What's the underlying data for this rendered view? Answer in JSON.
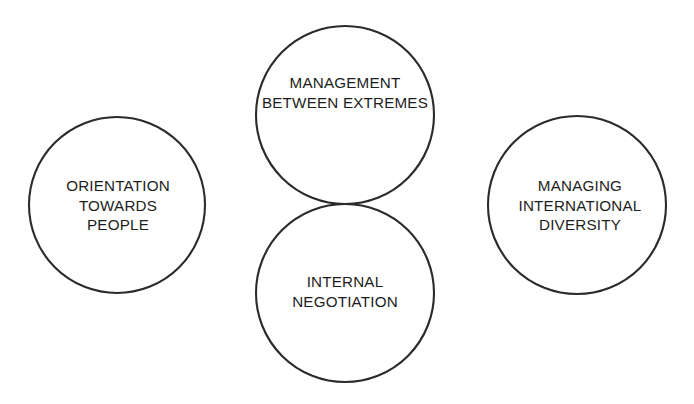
{
  "diagram": {
    "type": "four-circle-venn",
    "background_color": "#ffffff",
    "stroke_color": "#2b2b2b",
    "text_color": "#1d1d1d",
    "circles": [
      {
        "id": "management-between-extremes",
        "position": "top",
        "cx": 345,
        "cy": 115,
        "r": 89,
        "label_lines": [
          "MANAGEMENT",
          "BETWEEN EXTREMES"
        ]
      },
      {
        "id": "orientation-towards-people",
        "position": "left",
        "cx": 117,
        "cy": 205,
        "r": 88,
        "label_lines": [
          "ORIENTATION",
          "TOWARDS",
          "PEOPLE"
        ]
      },
      {
        "id": "managing-international-diversity",
        "position": "right",
        "cx": 577,
        "cy": 205,
        "r": 89,
        "label_lines": [
          "MANAGING",
          "INTERNATIONAL",
          "DIVERSITY"
        ]
      },
      {
        "id": "internal-negotiation",
        "position": "bottom",
        "cx": 345,
        "cy": 293,
        "r": 89,
        "label_lines": [
          "INTERNAL",
          "NEGOTIATION"
        ]
      }
    ],
    "intersection_nodes": [
      {
        "id": "left-node",
        "x": 295,
        "y": 205
      },
      {
        "id": "right-node",
        "x": 398,
        "y": 205
      }
    ]
  },
  "labels": {
    "management": {
      "line1": "MANAGEMENT",
      "line2": "BETWEEN EXTREMES"
    },
    "orientation": {
      "line1": "ORIENTATION",
      "line2": "TOWARDS",
      "line3": "PEOPLE"
    },
    "managing": {
      "line1": "MANAGING",
      "line2": "INTERNATIONAL",
      "line3": "DIVERSITY"
    },
    "internal": {
      "line1": "INTERNAL",
      "line2": "NEGOTIATION"
    }
  }
}
